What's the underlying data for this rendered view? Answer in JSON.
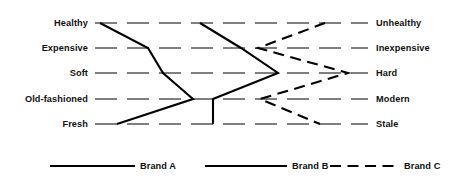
{
  "chart_data": {
    "type": "line",
    "title": "",
    "subtitle": "",
    "xlabel": "",
    "ylabel": "",
    "orientation": "horizontal-semantic-differential",
    "grid": true,
    "legend_position": "bottom",
    "scale": {
      "min": 1,
      "max": 7,
      "left_anchor_label": "left pole",
      "right_anchor_label": "right pole"
    },
    "axis_range_px": {
      "left": 95,
      "right": 368
    },
    "categories": [
      {
        "left": "Healthy",
        "right": "Unhealthy"
      },
      {
        "left": "Expensive",
        "right": "Inexpensive"
      },
      {
        "left": "Soft",
        "right": "Hard"
      },
      {
        "left": "Old-fashioned",
        "right": "Modern"
      },
      {
        "left": "Fresh",
        "right": "Stale"
      }
    ],
    "labels_left": [
      "Healthy",
      "Expensive",
      "Soft",
      "Old-fashioned",
      "Fresh"
    ],
    "labels_right": [
      "Unhealthy",
      "Inexpensive",
      "Hard",
      "Modern",
      "Stale"
    ],
    "row_y_px": [
      23,
      48,
      73,
      99,
      124
    ],
    "series": [
      {
        "name": "Brand A",
        "style": "solid",
        "color": "#000000",
        "values": [
          1.2,
          2.5,
          2.9,
          3.8,
          1.7
        ],
        "points_px": [
          [
            100,
            23
          ],
          [
            148,
            48
          ],
          [
            163,
            73
          ],
          [
            193,
            99
          ],
          [
            117,
            124
          ]
        ]
      },
      {
        "name": "Brand B",
        "style": "solid",
        "color": "#000000",
        "values": [
          3.8,
          4.8,
          6.2,
          4.4,
          4.4
        ],
        "points_px": [
          [
            200,
            23
          ],
          [
            241,
            48
          ],
          [
            278,
            73
          ],
          [
            213,
            99
          ],
          [
            213,
            124
          ]
        ]
      },
      {
        "name": "Brand C",
        "style": "dashed",
        "color": "#000000",
        "values": [
          6.7,
          5.1,
          7.0,
          5.2,
          6.6
        ],
        "points_px": [
          [
            325,
            23
          ],
          [
            258,
            48
          ],
          [
            348,
            73
          ],
          [
            260,
            99
          ],
          [
            320,
            124
          ]
        ]
      }
    ]
  },
  "legend": {
    "items": [
      {
        "label": "Brand A",
        "style": "solid",
        "swatch_x1": 50,
        "swatch_x2": 135,
        "text_x": 140
      },
      {
        "label": "Brand B",
        "style": "solid",
        "swatch_x1": 205,
        "swatch_x2": 287,
        "text_x": 292
      },
      {
        "label": "Brand C",
        "style": "dashed",
        "swatch_x1": 330,
        "swatch_x2": 400,
        "text_x": 404
      }
    ],
    "y_px": 166
  },
  "colors": {
    "background": "#ffffff",
    "ink": "#000000",
    "text": "#111111"
  }
}
